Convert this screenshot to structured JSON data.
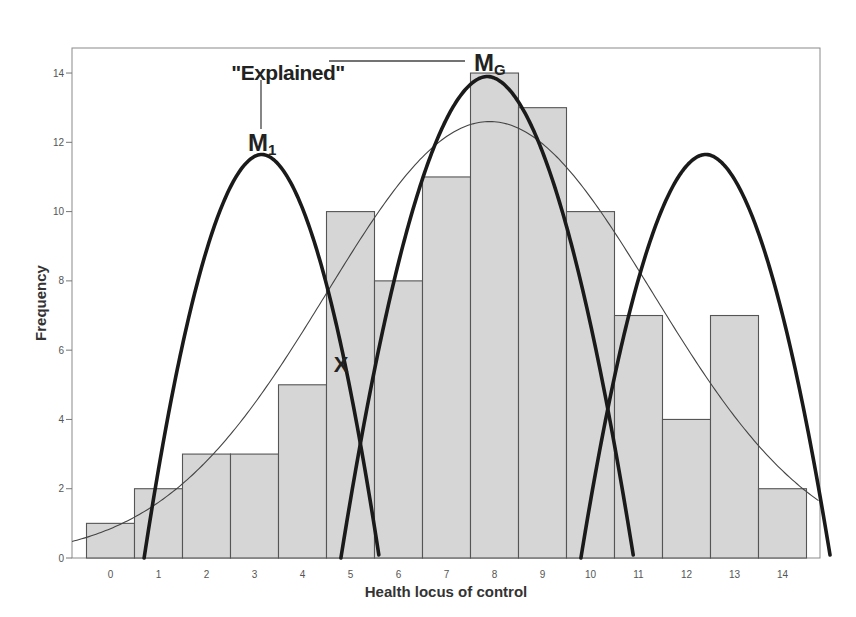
{
  "chart_data": {
    "type": "bar",
    "title": "",
    "xlabel": "Health locus of control",
    "ylabel": "Frequency",
    "categories": [
      "0",
      "1",
      "2",
      "3",
      "4",
      "5",
      "6",
      "7",
      "8",
      "9",
      "10",
      "11",
      "12",
      "13",
      "14"
    ],
    "values": [
      1,
      2,
      3,
      3,
      5,
      10,
      8,
      11,
      14,
      13,
      10,
      7,
      4,
      7,
      2
    ],
    "ylim": [
      0,
      14.8
    ],
    "yticks": [
      0,
      2,
      4,
      6,
      8,
      10,
      12,
      14
    ],
    "grid": false,
    "bar_color": "#d6d6d6",
    "bar_edge_color": "#555555",
    "overlays": [
      {
        "name": "normal-fit",
        "type": "line",
        "style": "thin",
        "mean": 7.9,
        "sd": 3.4,
        "peak": 12.6
      },
      {
        "name": "M1",
        "type": "parabola",
        "style": "thick",
        "center": 3.15,
        "peak": 11.65,
        "root_left": 0.7,
        "root_right": 5.6
      },
      {
        "name": "MG",
        "type": "parabola",
        "style": "thick",
        "center": 7.85,
        "peak": 13.9,
        "root_left": 4.8,
        "root_right": 10.9
      },
      {
        "name": "M3",
        "type": "parabola",
        "style": "thick",
        "center": 12.4,
        "peak": 11.65,
        "root_left": 9.8,
        "root_right": 15.0
      }
    ],
    "annotations": [
      {
        "text": "\"Explained\"",
        "x": 3.2,
        "y": 14.3
      },
      {
        "text": "M1",
        "main": "M",
        "sub": "1",
        "x": 3.15,
        "y": 12.0
      },
      {
        "text": "MG",
        "main": "M",
        "sub": "G",
        "x": 7.8,
        "y": 14.3
      },
      {
        "text": "X",
        "x": 4.8,
        "y": 5.7
      }
    ]
  },
  "labels": {
    "xlabel": "Health locus of control",
    "ylabel": "Frequency",
    "explained": "\"Explained\"",
    "m1_main": "M",
    "m1_sub": "1",
    "mg_main": "M",
    "mg_sub": "G",
    "x_mark": "X"
  }
}
